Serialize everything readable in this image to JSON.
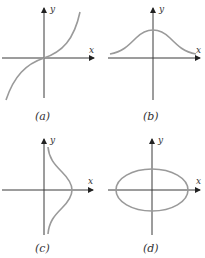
{
  "figure": {
    "panels": [
      {
        "id": "a",
        "caption": "(a)",
        "x_label": "x",
        "y_label": "y",
        "curve": "odd-increasing-s-curve"
      },
      {
        "id": "b",
        "caption": "(b)",
        "x_label": "x",
        "y_label": "y",
        "curve": "bell-curve"
      },
      {
        "id": "c",
        "caption": "(c)",
        "x_label": "x",
        "y_label": "y",
        "curve": "sideways-bell-curve"
      },
      {
        "id": "d",
        "caption": "(d)",
        "x_label": "x",
        "y_label": "y",
        "curve": "ellipse"
      }
    ],
    "colors": {
      "axis": "#3a3a3a",
      "curve": "#9a9a9a",
      "background": "#ffffff"
    }
  }
}
